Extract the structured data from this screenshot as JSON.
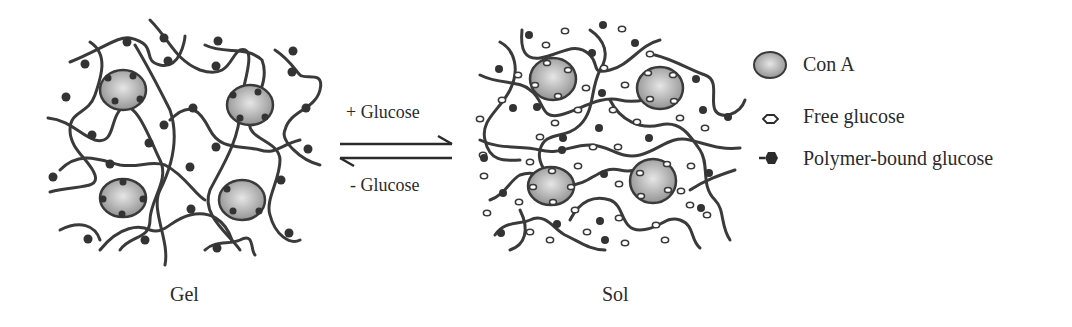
{
  "diagram": {
    "states": {
      "gel": {
        "label": "Gel"
      },
      "sol": {
        "label": "Sol"
      }
    },
    "arrows": {
      "forward": {
        "label": "+ Glucose"
      },
      "reverse": {
        "label": "- Glucose"
      }
    },
    "legend": {
      "items": [
        {
          "icon": "con-a-ellipse",
          "label": "Con A"
        },
        {
          "icon": "free-glucose-hexagon",
          "label": "Free glucose"
        },
        {
          "icon": "polymer-bound-glucose",
          "label": "Polymer-bound glucose"
        }
      ]
    },
    "colors": {
      "strand": "#3a3a3a",
      "con_a_fill": "#a9a9a9",
      "con_a_stroke": "#3a3a3a",
      "bound_glucose": "#333333",
      "text": "#2b2b2b"
    }
  }
}
